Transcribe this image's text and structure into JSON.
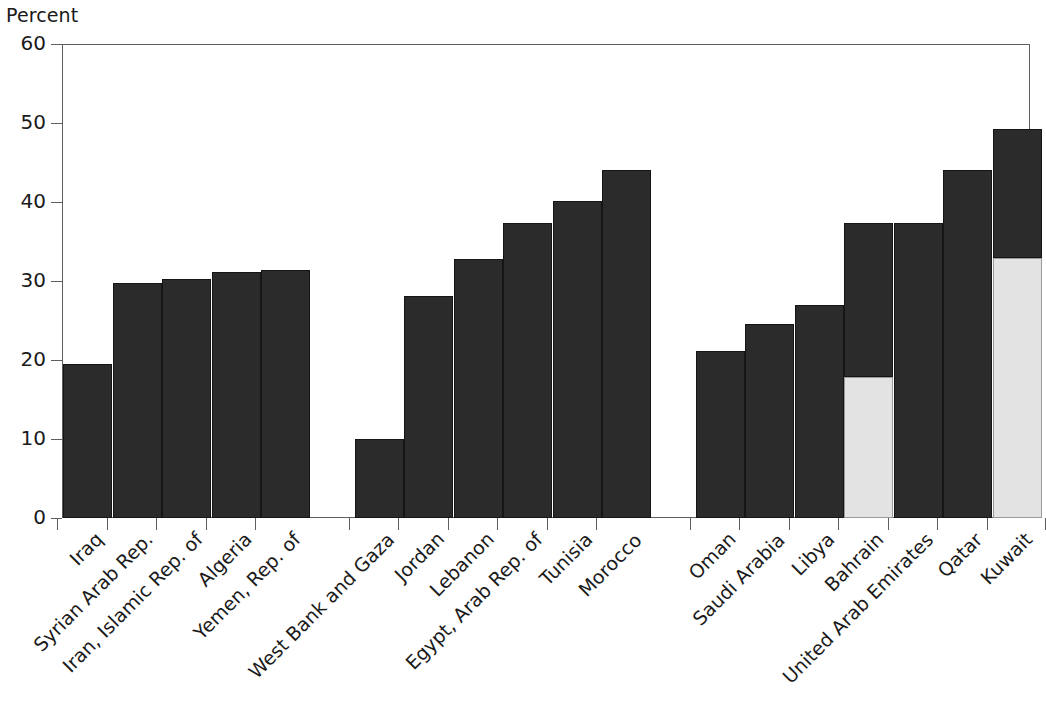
{
  "chart_data": {
    "type": "bar",
    "title": "",
    "subtitle": "",
    "xlabel": "",
    "ylabel": "Percent",
    "ylim": [
      0,
      60
    ],
    "yticks": [
      0,
      10,
      20,
      30,
      40,
      50,
      60
    ],
    "ytick_labels": [
      "0",
      "10",
      "20",
      "30",
      "40",
      "50",
      "60"
    ],
    "grid": false,
    "legend": null,
    "stacked": true,
    "series": [
      {
        "name": "dark-segment",
        "color": "#2b2b2b"
      },
      {
        "name": "light-segment",
        "color": "#e3e3e3"
      }
    ],
    "groups": [
      {
        "name": "group-1",
        "categories": [
          "Iraq",
          "Syrian Arab Rep.",
          "Iran, Islamic Rep. of",
          "Algeria",
          "Yemen, Rep. of"
        ],
        "values": [
          19.5,
          29.8,
          30.3,
          31.2,
          31.4
        ],
        "light_values": [
          0,
          0,
          0,
          0,
          0
        ]
      },
      {
        "name": "group-2",
        "categories": [
          "West Bank and Gaza",
          "Jordan",
          "Lebanon",
          "Egypt, Arab Rep. of",
          "Tunisia",
          "Morocco"
        ],
        "values": [
          10.0,
          28.1,
          32.8,
          37.4,
          40.1,
          44.0
        ],
        "light_values": [
          0,
          0,
          0,
          0,
          0,
          0
        ]
      },
      {
        "name": "group-3",
        "categories": [
          "Oman",
          "Saudi Arabia",
          "Libya",
          "Bahrain",
          "United Arab Emirates",
          "Qatar",
          "Kuwait"
        ],
        "values": [
          21.2,
          24.6,
          27.0,
          37.3,
          37.4,
          44.1,
          49.3
        ],
        "light_values": [
          0,
          0,
          0,
          17.8,
          0,
          0,
          32.9
        ]
      }
    ],
    "categories": [
      "Iraq",
      "Syrian Arab Rep.",
      "Iran, Islamic Rep. of",
      "Algeria",
      "Yemen, Rep. of",
      "West Bank and Gaza",
      "Jordan",
      "Lebanon",
      "Egypt, Arab Rep. of",
      "Tunisia",
      "Morocco",
      "Oman",
      "Saudi Arabia",
      "Libya",
      "Bahrain",
      "United Arab Emirates",
      "Qatar",
      "Kuwait"
    ],
    "values": [
      19.5,
      29.8,
      30.3,
      31.2,
      31.4,
      10.0,
      28.1,
      32.8,
      37.4,
      40.1,
      44.0,
      21.2,
      24.6,
      27.0,
      37.3,
      37.4,
      44.1,
      49.3
    ],
    "light_values": [
      0,
      0,
      0,
      0,
      0,
      0,
      0,
      0,
      0,
      0,
      0,
      0,
      0,
      0,
      17.8,
      0,
      0,
      32.9
    ]
  },
  "axis": {
    "y_title": "Percent"
  },
  "colors": {
    "bar_dark": "#2b2b2b",
    "bar_light": "#e3e3e3",
    "axis": "#5e5e5e",
    "text": "#1a1a1a",
    "background": "#ffffff"
  },
  "footer": {
    "cropped_caption": "partially cropped caption text"
  }
}
